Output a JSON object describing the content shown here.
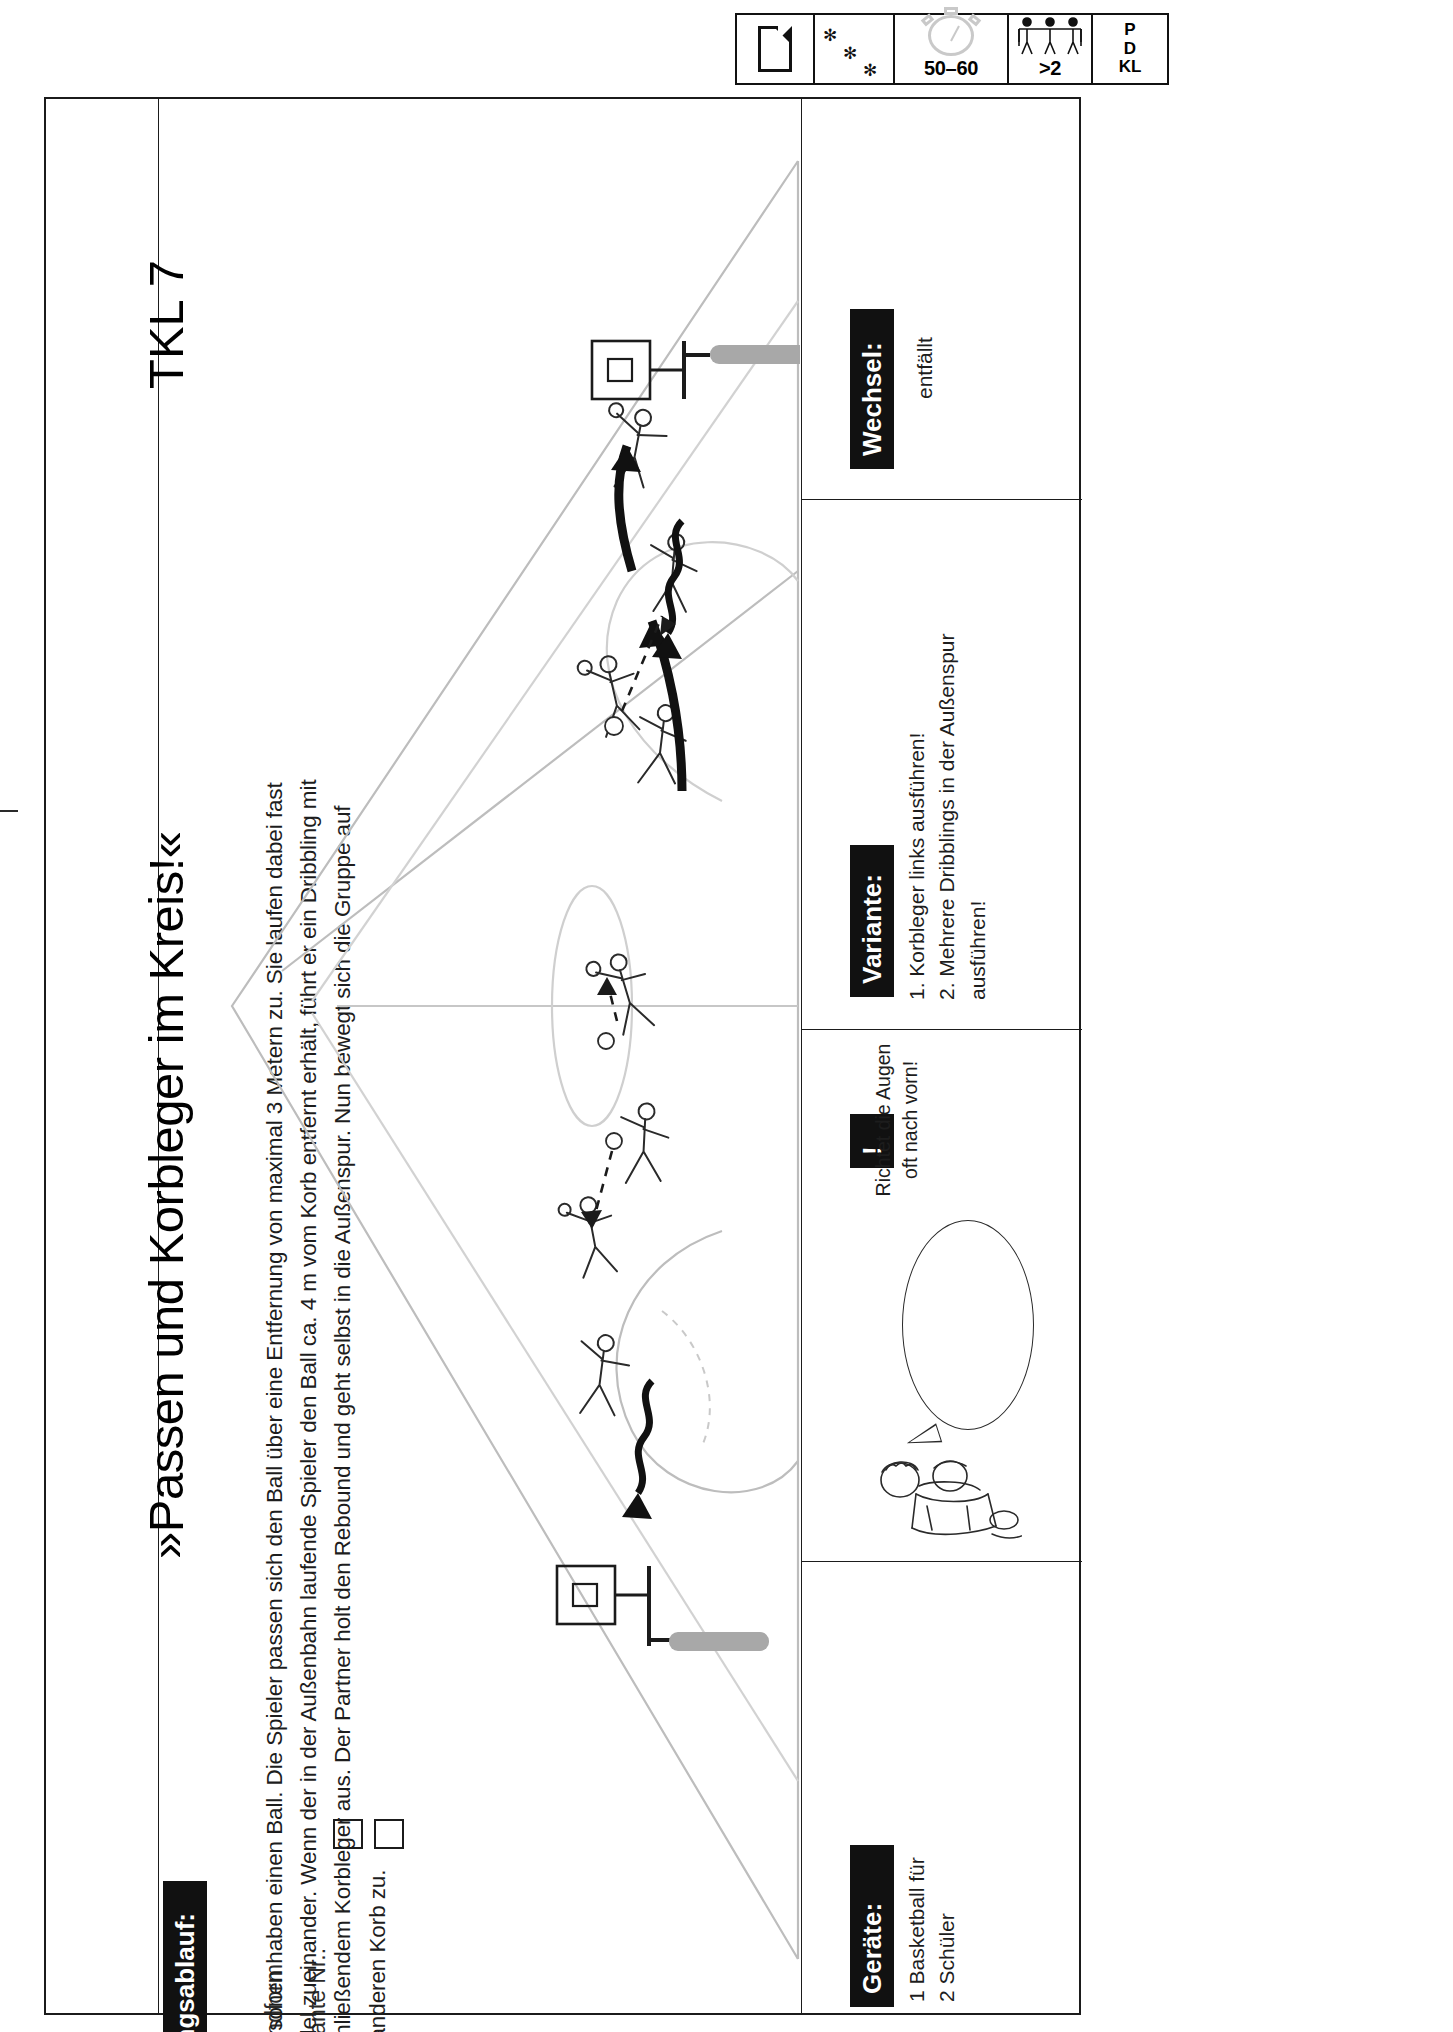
{
  "header_icons": {
    "document": {
      "name": "document-icon",
      "label": ""
    },
    "difficulty": {
      "name": "snowflake-icon",
      "symbol": "✻",
      "count": 3
    },
    "duration": {
      "name": "stopwatch-icon",
      "value": "50–60"
    },
    "group_size": {
      "name": "group-icon",
      "value": ">2"
    },
    "codes": {
      "line1": "P",
      "line2": "D",
      "line3": "KL"
    }
  },
  "title": {
    "main": "»Passen und Korbleger im Kreis!«",
    "code": "TKL 7"
  },
  "uebungsablauf": {
    "label": "Übungsablauf:",
    "options": [
      {
        "label": "Grundform",
        "checked": false
      },
      {
        "label": "Variante Nr.:",
        "checked": false
      }
    ],
    "description": "2 Personen haben einen Ball. Die Spieler passen sich den Ball über eine Entfernung von maximal 3 Metern zu. Sie laufen dabei fast parallel zueinander. Wenn der in der Außenbahn laufende Spieler den Ball ca. 4 m vom Korb entfernt erhält, führt er ein Dribbling mit anschließendem Korbleger aus. Der Partner holt den Rebound und geht selbst in die Außenspur. Nun bewegt sich die Gruppe auf den anderen Korb zu."
  },
  "sections": {
    "geraete": {
      "label": "Geräte:",
      "text": "1 Basketball für\n2 Schüler"
    },
    "hinweis": {
      "label": "!",
      "bubble_text": "Richtet die Augen\noft nach vorn!"
    },
    "variante": {
      "label": "Variante:",
      "text": "1. Korbleger links ausführen!\n2. Mehrere Dribblings in der Außenspur ausführen!"
    },
    "wechsel": {
      "label": "Wechsel:",
      "text": "entfällt"
    }
  },
  "diagram": {
    "name": "basketball-court-diagram",
    "alt": "Basketball court with two hoops, player figures passing and performing layups, motion arrows and dribble lines"
  }
}
